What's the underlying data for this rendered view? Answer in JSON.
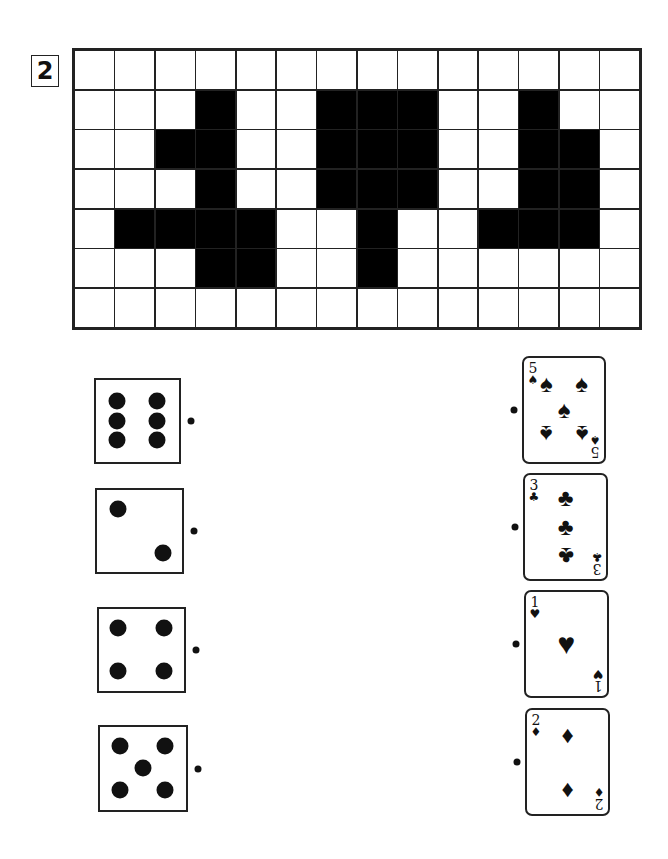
{
  "exercise": {
    "number": "2"
  },
  "pixel_grid": {
    "columns": 14,
    "rows": 7,
    "filled_cells": [
      [
        1,
        3
      ],
      [
        1,
        6
      ],
      [
        1,
        7
      ],
      [
        1,
        8
      ],
      [
        1,
        11
      ],
      [
        2,
        2
      ],
      [
        2,
        3
      ],
      [
        2,
        6
      ],
      [
        2,
        7
      ],
      [
        2,
        8
      ],
      [
        2,
        11
      ],
      [
        2,
        12
      ],
      [
        3,
        3
      ],
      [
        3,
        6
      ],
      [
        3,
        7
      ],
      [
        3,
        8
      ],
      [
        3,
        11
      ],
      [
        3,
        12
      ],
      [
        4,
        1
      ],
      [
        4,
        2
      ],
      [
        4,
        3
      ],
      [
        4,
        4
      ],
      [
        4,
        7
      ],
      [
        4,
        10
      ],
      [
        4,
        11
      ],
      [
        4,
        12
      ],
      [
        5,
        3
      ],
      [
        5,
        4
      ],
      [
        5,
        7
      ]
    ]
  },
  "dice": [
    {
      "value": 6,
      "pips": 6
    },
    {
      "value": 2,
      "pips": 2
    },
    {
      "value": 4,
      "pips": 4
    },
    {
      "value": 5,
      "pips": 5
    }
  ],
  "cards": [
    {
      "rank": "5",
      "suit": "spades",
      "symbol": "♠"
    },
    {
      "rank": "3",
      "suit": "clubs",
      "symbol": "♣"
    },
    {
      "rank": "1",
      "suit": "hearts",
      "symbol": "♥"
    },
    {
      "rank": "2",
      "suit": "diamonds",
      "symbol": "♦"
    }
  ],
  "colors": {
    "ink": "#111111",
    "background": "#ffffff"
  }
}
